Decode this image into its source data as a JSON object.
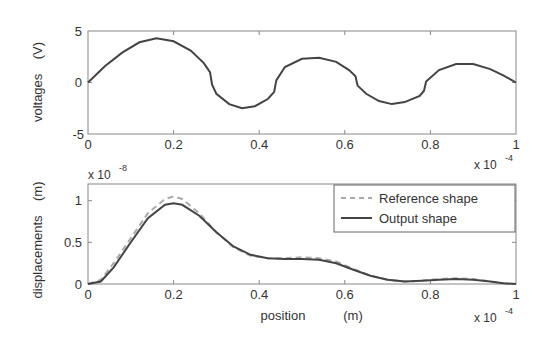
{
  "chart_data": [
    {
      "type": "line",
      "title": "",
      "xlabel": "",
      "ylabel": "voltages    (V)",
      "xlim": [
        0,
        1
      ],
      "ylim": [
        -5,
        5
      ],
      "x_scale_label": "x 10",
      "x_scale_exponent": "-4",
      "xticks": [
        "0",
        "0.2",
        "0.4",
        "0.6",
        "0.8",
        "1"
      ],
      "yticks": [
        "-5",
        "0",
        "5"
      ],
      "grid": false,
      "series": [
        {
          "name": "voltage",
          "style": "solid",
          "color": "#444444",
          "x": [
            0,
            0.04,
            0.08,
            0.12,
            0.16,
            0.2,
            0.24,
            0.27,
            0.285,
            0.29,
            0.3,
            0.33,
            0.36,
            0.39,
            0.42,
            0.435,
            0.44,
            0.46,
            0.5,
            0.54,
            0.58,
            0.61,
            0.625,
            0.63,
            0.65,
            0.68,
            0.71,
            0.74,
            0.775,
            0.785,
            0.79,
            0.82,
            0.86,
            0.9,
            0.94,
            0.97,
            1.0
          ],
          "y": [
            0,
            1.6,
            2.9,
            3.9,
            4.3,
            4.0,
            3.1,
            1.9,
            1.0,
            -0.2,
            -1.1,
            -2.1,
            -2.5,
            -2.3,
            -1.6,
            -0.9,
            0.2,
            1.5,
            2.3,
            2.4,
            2.0,
            1.2,
            0.6,
            -0.3,
            -1.1,
            -1.8,
            -2.1,
            -1.9,
            -1.3,
            -0.8,
            0.1,
            1.2,
            1.8,
            1.8,
            1.3,
            0.7,
            0.0
          ]
        }
      ]
    },
    {
      "type": "line",
      "title": "",
      "xlabel": "position      (m)",
      "ylabel": "displacements    (m)",
      "xlim": [
        0,
        1
      ],
      "ylim": [
        0,
        1.2
      ],
      "x_scale_label": "x 10",
      "x_scale_exponent": "-4",
      "y_scale_label": "x 10",
      "y_scale_exponent": "-8",
      "xticks": [
        "0",
        "0.2",
        "0.4",
        "0.6",
        "0.8",
        "1"
      ],
      "yticks": [
        "0",
        "0.5",
        "1"
      ],
      "grid": false,
      "legend_position": "upper right",
      "series": [
        {
          "name": "Reference shape",
          "style": "dashed",
          "color": "#aaaaaa",
          "x": [
            0,
            0.03,
            0.06,
            0.1,
            0.14,
            0.18,
            0.2,
            0.22,
            0.26,
            0.3,
            0.34,
            0.38,
            0.42,
            0.46,
            0.5,
            0.54,
            0.58,
            0.62,
            0.66,
            0.7,
            0.74,
            0.78,
            0.82,
            0.86,
            0.9,
            0.94,
            0.97,
            1.0
          ],
          "y": [
            0,
            0.05,
            0.25,
            0.55,
            0.85,
            1.02,
            1.05,
            1.02,
            0.85,
            0.62,
            0.44,
            0.34,
            0.31,
            0.31,
            0.32,
            0.31,
            0.27,
            0.18,
            0.1,
            0.05,
            0.03,
            0.04,
            0.06,
            0.07,
            0.06,
            0.03,
            0.01,
            0.0
          ]
        },
        {
          "name": "Output shape",
          "style": "solid",
          "color": "#444444",
          "x": [
            0,
            0.03,
            0.06,
            0.1,
            0.14,
            0.18,
            0.2,
            0.22,
            0.26,
            0.3,
            0.34,
            0.38,
            0.42,
            0.46,
            0.5,
            0.54,
            0.58,
            0.62,
            0.66,
            0.7,
            0.74,
            0.78,
            0.82,
            0.86,
            0.9,
            0.94,
            0.97,
            1.0
          ],
          "y": [
            0,
            0.03,
            0.2,
            0.5,
            0.79,
            0.95,
            0.97,
            0.95,
            0.82,
            0.62,
            0.45,
            0.35,
            0.31,
            0.3,
            0.3,
            0.29,
            0.25,
            0.17,
            0.1,
            0.05,
            0.03,
            0.04,
            0.05,
            0.06,
            0.05,
            0.03,
            0.01,
            0.0
          ]
        }
      ]
    }
  ],
  "plots": {
    "top": {
      "ylabel": "voltages    (V)",
      "yticks": [
        "5",
        "0",
        "-5"
      ],
      "xticks": [
        "0",
        "0.2",
        "0.4",
        "0.6",
        "0.8",
        "1"
      ],
      "scale_x": "x 10",
      "scale_x_exp": "-4"
    },
    "bottom": {
      "ylabel": "displacements    (m)",
      "yticks": [
        "1",
        "0.5",
        "0"
      ],
      "xticks": [
        "0",
        "0.2",
        "0.4",
        "0.6",
        "0.8",
        "1"
      ],
      "scale_y": "x 10",
      "scale_y_exp": "-8",
      "scale_x": "x 10",
      "scale_x_exp": "-4",
      "xlabel_name": "position",
      "xlabel_unit": "(m)",
      "legend": {
        "ref": "Reference shape",
        "out": "Output shape"
      }
    }
  }
}
